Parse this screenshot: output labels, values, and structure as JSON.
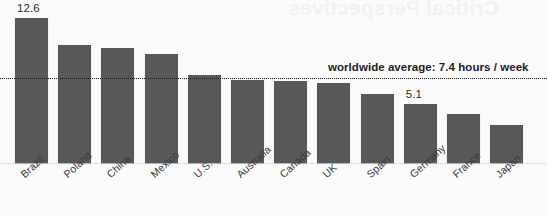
{
  "bleed_through_text": "Critical Perspectives",
  "annotation": {
    "average_note": "worldwide average: 7.4 hours / week"
  },
  "chart_data": {
    "type": "bar",
    "title": "",
    "xlabel": "",
    "ylabel": "",
    "ylim": [
      0,
      13.5
    ],
    "grid": false,
    "legend": "none",
    "categories": [
      "Brazil",
      "Poland",
      "China",
      "Mexico",
      "U.S.",
      "Australia",
      "Canada",
      "UK",
      "Spain",
      "Germany",
      "France",
      "Japan"
    ],
    "values": [
      12.6,
      10.3,
      10.0,
      9.5,
      7.7,
      7.2,
      7.1,
      7.0,
      6.0,
      5.1,
      4.3,
      3.3
    ],
    "point_labels": [
      {
        "category": "Brazil",
        "text": "12.6"
      },
      {
        "category": "Germany",
        "text": "5.1"
      }
    ],
    "reference_line": {
      "value": 7.4,
      "label": "worldwide average: 7.4 hours / week",
      "style": "dotted"
    },
    "colors": {
      "bar": "#585858",
      "background": "#fbfbfb",
      "reference_line": "#1d1d1d",
      "text": "#2b2b2b"
    }
  }
}
